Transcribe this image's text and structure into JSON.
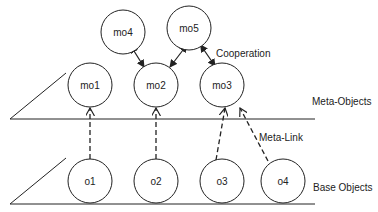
{
  "diagram": {
    "meta_objects": [
      {
        "id": "mo1",
        "label": "mo1",
        "cx": 90,
        "cy": 85
      },
      {
        "id": "mo2",
        "label": "mo2",
        "cx": 156,
        "cy": 85
      },
      {
        "id": "mo3",
        "label": "mo3",
        "cx": 222,
        "cy": 85
      },
      {
        "id": "mo4",
        "label": "mo4",
        "cx": 123,
        "cy": 32
      },
      {
        "id": "mo5",
        "label": "mo5",
        "cx": 189,
        "cy": 28
      }
    ],
    "base_objects": [
      {
        "id": "o1",
        "label": "o1",
        "cx": 90,
        "cy": 181
      },
      {
        "id": "o2",
        "label": "o2",
        "cx": 156,
        "cy": 181
      },
      {
        "id": "o3",
        "label": "o3",
        "cx": 222,
        "cy": 181
      },
      {
        "id": "o4",
        "label": "o4",
        "cx": 283,
        "cy": 181
      }
    ],
    "labels": {
      "cooperation": "Cooperation",
      "meta_objects_layer": "Meta-Objects",
      "meta_link": "Meta-Link",
      "base_objects_layer": "Base Objects"
    }
  }
}
